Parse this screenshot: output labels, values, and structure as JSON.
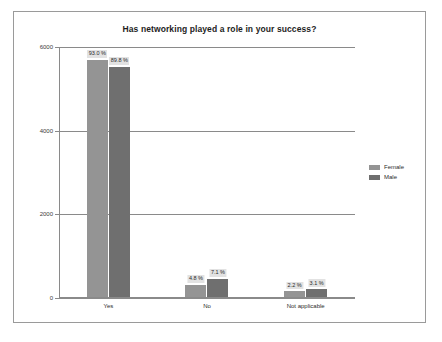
{
  "chart_data": {
    "type": "bar",
    "title": "Has networking played a role in your success?",
    "xlabel": "",
    "ylabel": "",
    "ylim": [
      0,
      6000
    ],
    "yticks": [
      "0",
      "2000",
      "4000",
      "6000"
    ],
    "grid": true,
    "legend_position": "right",
    "categories": [
      "Yes",
      "No",
      "Not applicable"
    ],
    "series": [
      {
        "name": "Female",
        "color": "#949494",
        "values": [
          5670,
          293,
          134
        ],
        "labels": [
          "93.0 %",
          "4.8 %",
          "2.2 %"
        ]
      },
      {
        "name": "Male",
        "color": "#6f6f6f",
        "values": [
          5510,
          436,
          190
        ],
        "labels": [
          "89.8 %",
          "7.1 %",
          "3.1 %"
        ]
      }
    ]
  },
  "frame": {
    "border_color": "#9a9a9a",
    "background": "#ffffff"
  }
}
